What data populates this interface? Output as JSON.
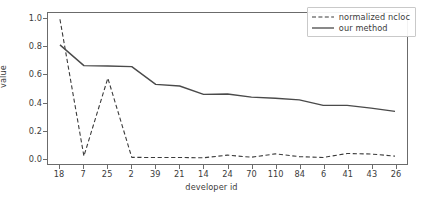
{
  "chart_data": {
    "type": "line",
    "title": "",
    "xlabel": "developer id",
    "ylabel": "value",
    "categories": [
      "18",
      "7",
      "25",
      "2",
      "39",
      "21",
      "14",
      "24",
      "70",
      "110",
      "84",
      "6",
      "41",
      "43",
      "26"
    ],
    "yticks": [
      "0.0",
      "0.2",
      "0.4",
      "0.6",
      "0.8",
      "1.0"
    ],
    "ytick_values": [
      0.0,
      0.2,
      0.4,
      0.6,
      0.8,
      1.0
    ],
    "ylim": [
      -0.045,
      1.045
    ],
    "xlim": [
      -0.5,
      14.5
    ],
    "grid": false,
    "legend_position": "upper right",
    "series": [
      {
        "name": "normalized ncloc",
        "style": "dashed",
        "color": "#3b3b3b",
        "values": [
          1.0,
          0.012,
          0.575,
          0.003,
          0.002,
          0.002,
          0.0,
          0.019,
          0.004,
          0.028,
          0.008,
          0.002,
          0.031,
          0.027,
          0.012
        ]
      },
      {
        "name": "our method",
        "style": "solid",
        "color": "#4a4a4a",
        "values": [
          0.815,
          0.665,
          0.662,
          0.658,
          0.53,
          0.518,
          0.458,
          0.46,
          0.438,
          0.43,
          0.418,
          0.378,
          0.378,
          0.358,
          0.335
        ]
      }
    ]
  },
  "legend": {
    "entries": [
      {
        "label": "normalized ncloc"
      },
      {
        "label": "our method"
      }
    ]
  }
}
